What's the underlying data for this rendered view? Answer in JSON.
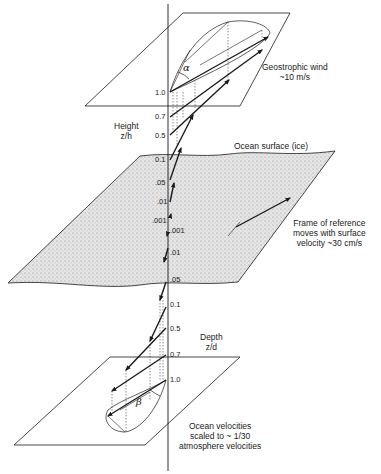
{
  "diagram": {
    "title_labels": {
      "geostrophic_wind": [
        "Geostrophic wind",
        "~10 m/s"
      ],
      "height_axis": [
        "Height",
        "z/h"
      ],
      "ocean_surface": "Ocean surface (ice)",
      "frame_of_reference": [
        "Frame of reference",
        "moves with surface",
        "velocity ~30 cm/s"
      ],
      "depth_axis": [
        "Depth",
        "z/d"
      ],
      "ocean_velocities": [
        "Ocean velocities",
        "scaled to ~ 1/30",
        "atmosphere velocities"
      ]
    },
    "angles": {
      "atmosphere": "α",
      "ocean": "β"
    },
    "height_ticks": [
      "1.0",
      "0.7",
      "0.5",
      "0.1",
      ".05",
      ".01",
      ".001"
    ],
    "depth_ticks": [
      ".001",
      ".01",
      ".05",
      "0.1",
      "0.5",
      "0.7",
      "1.0"
    ],
    "colors": {
      "ink": "#1a1a1a",
      "ice_fill": "#d9d9d9",
      "background": "#ffffff"
    }
  }
}
